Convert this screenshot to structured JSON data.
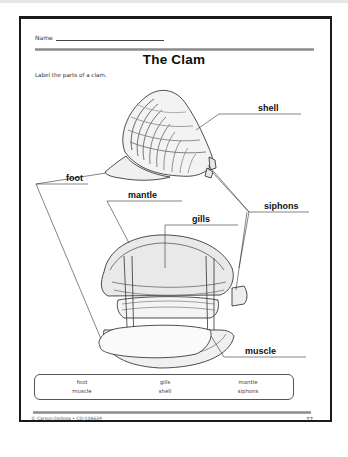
{
  "worksheet": {
    "name_label": "Name",
    "title": "The Clam",
    "instructions": "Label the parts of a clam."
  },
  "diagram": {
    "labels": {
      "shell": "shell",
      "foot": "foot",
      "mantle": "mantle",
      "gills": "gills",
      "siphons": "siphons",
      "muscle": "muscle"
    }
  },
  "word_bank": {
    "words": [
      [
        "foot",
        "gills",
        "mantle"
      ],
      [
        "muscle",
        "shell",
        "siphons"
      ]
    ]
  },
  "footer": {
    "copyright": "© Carson-Dellosa • CD-104639",
    "page_number": "77"
  },
  "colors": {
    "frame": "#1a1a1a",
    "rule": "#9a9a9a",
    "text": "#111111"
  }
}
